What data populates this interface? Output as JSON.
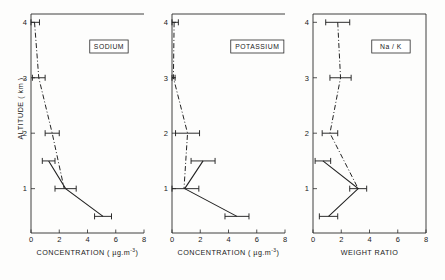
{
  "figure": {
    "title": "",
    "ylabel": "ALTITUDE  ( km )",
    "y_ticks": [
      "1",
      "2",
      "3",
      "4"
    ],
    "y_values": [
      1,
      2,
      3,
      4
    ],
    "ylim": [
      0.2,
      4.15
    ]
  },
  "chart_data": [
    {
      "type": "line",
      "title": "SODIUM",
      "panel_tag": "SODIUM",
      "xlabel": "CONCENTRATION ( µg.m",
      "xlabel_sup": "-3",
      "xlabel_tail": ")",
      "ylabel": "ALTITUDE ( km )",
      "xlim": [
        0,
        8
      ],
      "ylim": [
        0.2,
        4.15
      ],
      "x_ticks": [
        "0",
        "2",
        "4",
        "6",
        "8"
      ],
      "x_tick_values": [
        0,
        2,
        4,
        6,
        8
      ],
      "y_ticks": [
        "1",
        "2",
        "3",
        "4"
      ],
      "y_tick_values": [
        1,
        2,
        3,
        4
      ],
      "grid": false,
      "legend": "none",
      "series": [
        {
          "name": "profile-dash-dot",
          "style": "dash-dot",
          "points": [
            {
              "altitude": 4.0,
              "value": 0.25,
              "err": 0.35
            },
            {
              "altitude": 3.0,
              "value": 0.55,
              "err": 0.45
            },
            {
              "altitude": 2.0,
              "value": 1.5,
              "err": 0.5
            },
            {
              "altitude": 1.0,
              "value": 2.35,
              "err": 0.0
            }
          ]
        },
        {
          "name": "profile-solid",
          "style": "solid",
          "points": [
            {
              "altitude": 1.5,
              "value": 1.25,
              "err": 0.45
            },
            {
              "altitude": 1.0,
              "value": 2.45,
              "err": 0.75
            },
            {
              "altitude": 0.5,
              "value": 5.1,
              "err": 0.6
            }
          ]
        }
      ]
    },
    {
      "type": "line",
      "title": "POTASSIUM",
      "panel_tag": "POTASSIUM",
      "xlabel": "CONCENTRATION ( µg.m",
      "xlabel_sup": "-3",
      "xlabel_tail": ")",
      "ylabel": "ALTITUDE ( km )",
      "xlim": [
        0,
        8
      ],
      "ylim": [
        0.2,
        4.15
      ],
      "x_ticks": [
        "0",
        "2",
        "4",
        "6",
        "8"
      ],
      "x_tick_values": [
        0,
        2,
        4,
        6,
        8
      ],
      "y_ticks": [
        "1",
        "2",
        "3",
        "4"
      ],
      "y_tick_values": [
        1,
        2,
        3,
        4
      ],
      "grid": false,
      "legend": "none",
      "series": [
        {
          "name": "profile-dash-dot",
          "style": "dash-dot",
          "points": [
            {
              "altitude": 4.0,
              "value": 0.15,
              "err": 0.3
            },
            {
              "altitude": 3.0,
              "value": 0.1,
              "err": 0.12
            },
            {
              "altitude": 2.0,
              "value": 1.1,
              "err": 0.85
            },
            {
              "altitude": 1.0,
              "value": 0.85,
              "err": 0.0
            }
          ]
        },
        {
          "name": "profile-solid",
          "style": "solid",
          "points": [
            {
              "altitude": 1.5,
              "value": 2.2,
              "err": 0.85
            },
            {
              "altitude": 1.0,
              "value": 0.9,
              "err": 1.0
            },
            {
              "altitude": 0.5,
              "value": 4.6,
              "err": 0.85
            }
          ]
        }
      ]
    },
    {
      "type": "line",
      "title": "Na / K",
      "panel_tag": "Na / K",
      "xlabel": "WEIGHT  RATIO",
      "xlabel_sup": "",
      "xlabel_tail": "",
      "ylabel": "ALTITUDE ( km )",
      "xlim": [
        0,
        8
      ],
      "ylim": [
        0.2,
        4.15
      ],
      "x_ticks": [
        "0",
        "2",
        "4",
        "6",
        "8"
      ],
      "x_tick_values": [
        0,
        2,
        4,
        6,
        8
      ],
      "y_ticks": [
        "1",
        "2",
        "3",
        "4"
      ],
      "y_tick_values": [
        1,
        2,
        3,
        4
      ],
      "grid": false,
      "legend": "none",
      "series": [
        {
          "name": "profile-dash-dot",
          "style": "dash-dot",
          "points": [
            {
              "altitude": 4.0,
              "value": 1.75,
              "err": 0.85
            },
            {
              "altitude": 3.0,
              "value": 1.95,
              "err": 0.75
            },
            {
              "altitude": 2.0,
              "value": 1.2,
              "err": 0.55
            },
            {
              "altitude": 1.0,
              "value": 3.2,
              "err": 0.0
            }
          ]
        },
        {
          "name": "profile-solid",
          "style": "solid",
          "points": [
            {
              "altitude": 1.5,
              "value": 0.7,
              "err": 0.55
            },
            {
              "altitude": 1.0,
              "value": 3.2,
              "err": 0.6
            },
            {
              "altitude": 0.5,
              "value": 1.1,
              "err": 0.65
            }
          ]
        }
      ]
    }
  ]
}
